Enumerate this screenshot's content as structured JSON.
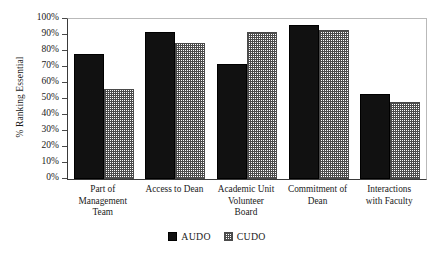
{
  "chart_data": {
    "type": "bar",
    "title": "",
    "xlabel": "",
    "ylabel": "% Ranking Essential",
    "ylim": [
      0,
      100
    ],
    "grid": false,
    "legend_position": "bottom",
    "categories": [
      "Part of Management Team",
      "Access to Dean",
      "Academic Unit Volunteer Board",
      "Commitment of Dean",
      "Interactions with Faculty"
    ],
    "series": [
      {
        "name": "AUDO",
        "color": "#111111",
        "values": [
          78,
          92,
          72,
          96,
          53
        ]
      },
      {
        "name": "CUDO",
        "color": "#4c4c4c",
        "values": [
          56,
          85,
          92,
          93,
          48
        ]
      }
    ],
    "ytick_labels": [
      "100%",
      "90%",
      "80%",
      "70%",
      "60%",
      "50%",
      "40%",
      "30%",
      "20%",
      "10%",
      "0%"
    ],
    "ytick_values": [
      100,
      90,
      80,
      70,
      60,
      50,
      40,
      30,
      20,
      10,
      0
    ]
  },
  "axis": {
    "y_title": "% Ranking Essential"
  },
  "category_labels": [
    {
      "lines": [
        "Part of",
        "Management",
        "Team"
      ]
    },
    {
      "lines": [
        "Access to Dean"
      ]
    },
    {
      "lines": [
        "Academic Unit",
        "Volunteer",
        "Board"
      ]
    },
    {
      "lines": [
        "Commitment of",
        "Dean"
      ]
    },
    {
      "lines": [
        "Interactions",
        "with Faculty"
      ]
    }
  ],
  "legend": {
    "items": [
      {
        "label": "AUDO",
        "pattern": "solid-black"
      },
      {
        "label": "CUDO",
        "pattern": "cross-hatch"
      }
    ]
  }
}
